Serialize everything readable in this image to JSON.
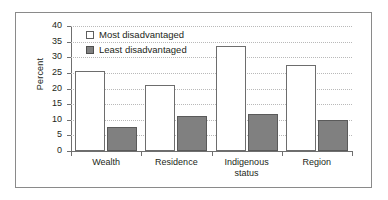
{
  "chart_data": {
    "type": "bar",
    "title": "",
    "xlabel": "",
    "ylabel": "Percent",
    "ylim": [
      0,
      40
    ],
    "yticks": [
      0,
      5,
      10,
      15,
      20,
      25,
      30,
      35,
      40
    ],
    "grid": true,
    "legend_position": "top-left",
    "categories": [
      "Wealth",
      "Residence",
      "Indigenous status",
      "Region"
    ],
    "category_lines": [
      [
        "Wealth"
      ],
      [
        "Residence"
      ],
      [
        "Indigenous",
        "status"
      ],
      [
        "Region"
      ]
    ],
    "series": [
      {
        "name": "Most disadvantaged",
        "color": "#ffffff",
        "values": [
          25.5,
          21.0,
          33.7,
          27.5
        ]
      },
      {
        "name": "Least disadvantaged",
        "color": "#808080",
        "values": [
          7.8,
          11.1,
          11.7,
          10.0
        ]
      }
    ]
  },
  "axis": {
    "y_title": "Percent",
    "y_tick_labels": [
      "40",
      "35",
      "30",
      "25",
      "20",
      "15",
      "10",
      "5",
      "0"
    ]
  },
  "legend": {
    "items": [
      {
        "label": "Most disadvantaged",
        "swatch": "open-square-icon"
      },
      {
        "label": "Least disadvantaged",
        "swatch": "filled-square-icon"
      }
    ]
  },
  "colors": {
    "bar_most": "#ffffff",
    "bar_least": "#808080",
    "bar_outline": "#6d6d6d",
    "gridline": "#b9b9b9",
    "axis": "#6f6f6f",
    "frame": "#8a8a8a",
    "text": "#231f20"
  }
}
